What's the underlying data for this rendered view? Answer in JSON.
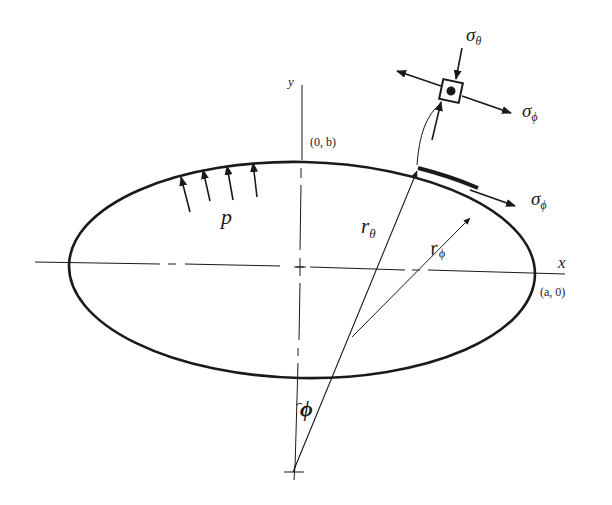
{
  "figure": {
    "type": "ellipsoidal shell cross-section (membrane stresses)",
    "axes": {
      "y_label": "y",
      "x_label": "x"
    },
    "points": {
      "top": "(0, b)",
      "right": "(a, 0)"
    },
    "pressure_label": "p",
    "radii": {
      "r_theta": {
        "base": "r",
        "sub": "θ"
      },
      "r_phi": {
        "base": "r",
        "sub": "ϕ"
      }
    },
    "angle_label": "ϕ",
    "stresses": {
      "sigma_theta": {
        "base": "σ",
        "sub": "θ"
      },
      "sigma_phi_element": {
        "base": "σ",
        "sub": "ϕ"
      },
      "sigma_phi_tangent": {
        "base": "σ",
        "sub": "ϕ"
      }
    },
    "colors": {
      "ink": "#1a1a1a",
      "background": "#ffffff"
    }
  }
}
